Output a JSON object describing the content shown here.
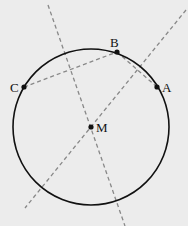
{
  "diagram": {
    "circle": {
      "cx": 91,
      "cy": 127,
      "r": 78,
      "stroke": "#111111"
    },
    "points": [
      {
        "name": "A",
        "x": 157,
        "y": 87,
        "label": "A",
        "lx": 162,
        "ly": 92
      },
      {
        "name": "B",
        "x": 117,
        "y": 52,
        "label": "B",
        "lx": 110,
        "ly": 47
      },
      {
        "name": "C",
        "x": 24,
        "y": 87,
        "label": "C",
        "lx": 10,
        "ly": 92
      },
      {
        "name": "M",
        "x": 91,
        "y": 127,
        "label": "M",
        "lx": 96,
        "ly": 132
      }
    ],
    "dashed_lines": [
      {
        "name": "chord-CB",
        "x1": 24,
        "y1": 87,
        "x2": 117,
        "y2": 52
      },
      {
        "name": "chord-BA",
        "x1": 117,
        "y1": 52,
        "x2": 157,
        "y2": 87
      },
      {
        "name": "bisector-CB",
        "x1": 48,
        "y1": 5,
        "x2": 125,
        "y2": 226
      },
      {
        "name": "bisector-BA",
        "x1": 186,
        "y1": 10,
        "x2": 25,
        "y2": 96
      }
    ],
    "dash_color": "#888888"
  }
}
